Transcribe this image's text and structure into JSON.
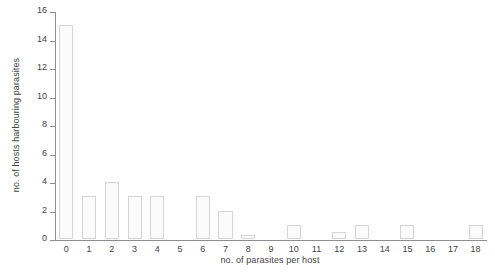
{
  "chart_data": {
    "type": "bar",
    "title": "",
    "xlabel": "no. of parasites per host",
    "ylabel": "no. of hosts harbouring parasites",
    "categories": [
      "0",
      "1",
      "2",
      "3",
      "4",
      "5",
      "6",
      "7",
      "8",
      "9",
      "10",
      "11",
      "12",
      "13",
      "14",
      "15",
      "16",
      "17",
      "18"
    ],
    "values": [
      15,
      3,
      4,
      3,
      3,
      0,
      3,
      2,
      0.25,
      0,
      1,
      0,
      0.5,
      1,
      0,
      1,
      0,
      0,
      1
    ],
    "xlim": [
      -0.5,
      18.5
    ],
    "ylim": [
      0,
      16
    ],
    "yticks": [
      0,
      2,
      4,
      6,
      8,
      10,
      12,
      14,
      16
    ],
    "ytick_labels": [
      "0",
      "2",
      "4",
      "6",
      "8",
      "10",
      "12",
      "14",
      "16"
    ],
    "xticks": [
      0,
      1,
      2,
      3,
      4,
      5,
      6,
      7,
      8,
      9,
      10,
      11,
      12,
      13,
      14,
      15,
      16,
      17,
      18
    ],
    "grid": false,
    "legend": null,
    "bar_fill_color": "#fbfbfb",
    "bar_edge_color": "#d4d4d4",
    "axis_color": "#8e8e8e",
    "text_color": "#444444"
  }
}
